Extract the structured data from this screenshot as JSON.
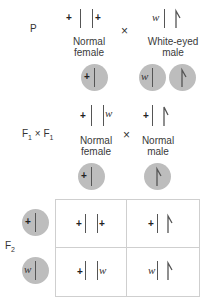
{
  "generations": {
    "p_label": "P",
    "f1_cross_label": "F",
    "f1_sub": "1",
    "f1_times": "×",
    "f1_cross_label2": "F",
    "f1_sub2": "1",
    "f2_label": "F",
    "f2_sub": "2"
  },
  "parental": {
    "female": {
      "allele_left": "+",
      "allele_right": "+",
      "label_line1": "Normal",
      "label_line2": "female"
    },
    "cross_symbol": "×",
    "male": {
      "allele_x": "w",
      "label_line1": "White-eyed",
      "label_line2": "male"
    },
    "gametes": [
      {
        "allele": "+",
        "type": "X"
      },
      {
        "allele": "w",
        "type": "X"
      },
      {
        "allele": "",
        "type": "Y"
      }
    ]
  },
  "f1": {
    "female": {
      "allele_left": "+",
      "allele_right": "w",
      "label_line1": "Normal",
      "label_line2": "female"
    },
    "cross_symbol": "×",
    "male": {
      "allele_x": "+",
      "label_line1": "Normal",
      "label_line2": "male"
    },
    "gametes": [
      {
        "allele": "+",
        "type": "X"
      },
      {
        "allele": "",
        "type": "Y"
      }
    ]
  },
  "f2_punnett": {
    "row_gametes": [
      {
        "allele": "+",
        "type": "X"
      },
      {
        "allele": "w",
        "type": "X"
      }
    ],
    "cells": [
      [
        {
          "left": "+",
          "right": "+",
          "type": "XX"
        },
        {
          "left": "+",
          "type": "XY"
        }
      ],
      [
        {
          "left": "+",
          "right": "w",
          "type": "XX"
        },
        {
          "left": "w",
          "type": "XY"
        }
      ]
    ]
  },
  "colors": {
    "gamete_fill": "#bdbdbd",
    "chromosome": "#555555",
    "grid": "#cfcfcf"
  }
}
